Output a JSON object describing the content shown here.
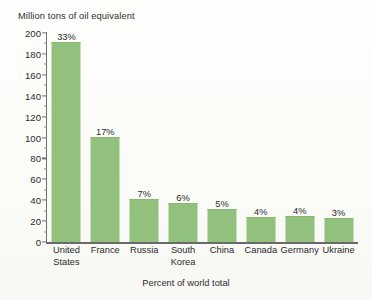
{
  "chart_data": {
    "type": "bar",
    "title": "",
    "ylabel": "Million tons of oil equivalent",
    "xlabel": "Percent of world total",
    "ylim": [
      0,
      200
    ],
    "ytick_step": 20,
    "grid": false,
    "legend": "none",
    "bar_color": "#92c17e",
    "categories": [
      "United States",
      "France",
      "Russia",
      "South Korea",
      "China",
      "Canada",
      "Germany",
      "Ukraine"
    ],
    "category_lines": [
      [
        "United",
        "States"
      ],
      [
        "France"
      ],
      [
        "Russia"
      ],
      [
        "South",
        "Korea"
      ],
      [
        "China"
      ],
      [
        "Canada"
      ],
      [
        "Germany"
      ],
      [
        "Ukraine"
      ]
    ],
    "values": [
      190,
      100,
      40,
      36,
      31,
      23,
      24,
      22
    ],
    "data_labels": [
      "33%",
      "17%",
      "7%",
      "6%",
      "5%",
      "4%",
      "4%",
      "3%"
    ],
    "yticks": [
      {
        "value": 200,
        "label": "200"
      },
      {
        "value": 180,
        "label": "180"
      },
      {
        "value": 160,
        "label": "160"
      },
      {
        "value": 140,
        "label": "140"
      },
      {
        "value": 120,
        "label": "120"
      },
      {
        "value": 100,
        "label": "100"
      },
      {
        "value": 80,
        "label": "80"
      },
      {
        "value": 60,
        "label": "60"
      },
      {
        "value": 40,
        "label": "40"
      },
      {
        "value": 20,
        "label": "20"
      },
      {
        "value": 0,
        "label": "0"
      }
    ]
  }
}
